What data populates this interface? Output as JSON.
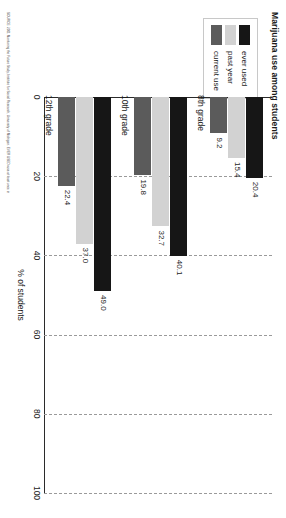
{
  "chart_data": {
    "type": "bar",
    "orientation": "horizontal",
    "title": "Marijuana use among students",
    "xlabel": "% of students",
    "ylabel": "",
    "xlim": [
      0,
      100
    ],
    "grid": true,
    "legend_position": "top-left",
    "categories": [
      "8th grade",
      "10th grade",
      "12th grade"
    ],
    "ticks": [
      "0",
      "20",
      "40",
      "60",
      "80",
      "100"
    ],
    "tick_values": [
      0,
      20,
      40,
      60,
      80,
      100
    ],
    "series": [
      {
        "name": "ever used",
        "color": "#161616",
        "values": [
          20.4,
          40.1,
          49.0
        ],
        "labels": [
          "20.4",
          "40.1",
          "49.0"
        ]
      },
      {
        "name": "past year",
        "color": "#d2d2d2",
        "values": [
          15.4,
          32.7,
          37.0
        ],
        "labels": [
          "15.4",
          "32.7",
          "37.0"
        ]
      },
      {
        "name": "current use",
        "color": "#5b5b5b",
        "values": [
          9.2,
          19.8,
          22.4
        ],
        "labels": [
          "9.2",
          "19.8",
          "22.4"
        ]
      }
    ]
  },
  "source": {
    "note": "SOURCE: 2001 Monitoring the Future Study, Institute for Social Research, University of Michigan. EVER USED=use at least once in"
  }
}
